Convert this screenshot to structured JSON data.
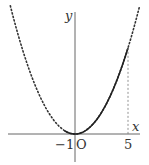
{
  "chart_data": {
    "type": "line",
    "title": "",
    "xlabel": "x",
    "ylabel": "y",
    "origin_label": "O",
    "x_tick_labels": [
      "-1",
      "5"
    ],
    "x_ticks": [
      -1,
      5
    ],
    "xlim": [
      -7,
      6.5
    ],
    "ylim": [
      -2,
      13
    ],
    "grid": false,
    "legend": null,
    "series": [
      {
        "name": "parabola (dotted, full)",
        "style": "dotted",
        "function": "y = a*x^2",
        "x": [
          -6,
          -5,
          -4,
          -3,
          -2,
          -1,
          0,
          1,
          2,
          3,
          4,
          5,
          6
        ],
        "y": [
          11.6,
          8.1,
          5.2,
          2.9,
          1.3,
          0.3,
          0,
          0.3,
          1.3,
          2.9,
          5.2,
          8.1,
          11.6
        ]
      },
      {
        "name": "parabola (solid, -1 ≤ x ≤ 5)",
        "style": "solid",
        "x": [
          -1,
          0,
          1,
          2,
          3,
          4,
          5
        ],
        "y": [
          0.3,
          0,
          0.3,
          1.3,
          2.9,
          5.2,
          8.1
        ]
      }
    ],
    "annotations": [
      {
        "type": "vertical-dashed-line",
        "x": 5,
        "from_y": 0,
        "to_y": 8.1
      }
    ]
  },
  "labels": {
    "x_axis": "x",
    "y_axis": "y",
    "origin": "O",
    "tick_neg1": "−1",
    "tick_5": "5"
  },
  "colors": {
    "axis": "#555555",
    "curve": "#222222",
    "dotted": "#333333"
  }
}
